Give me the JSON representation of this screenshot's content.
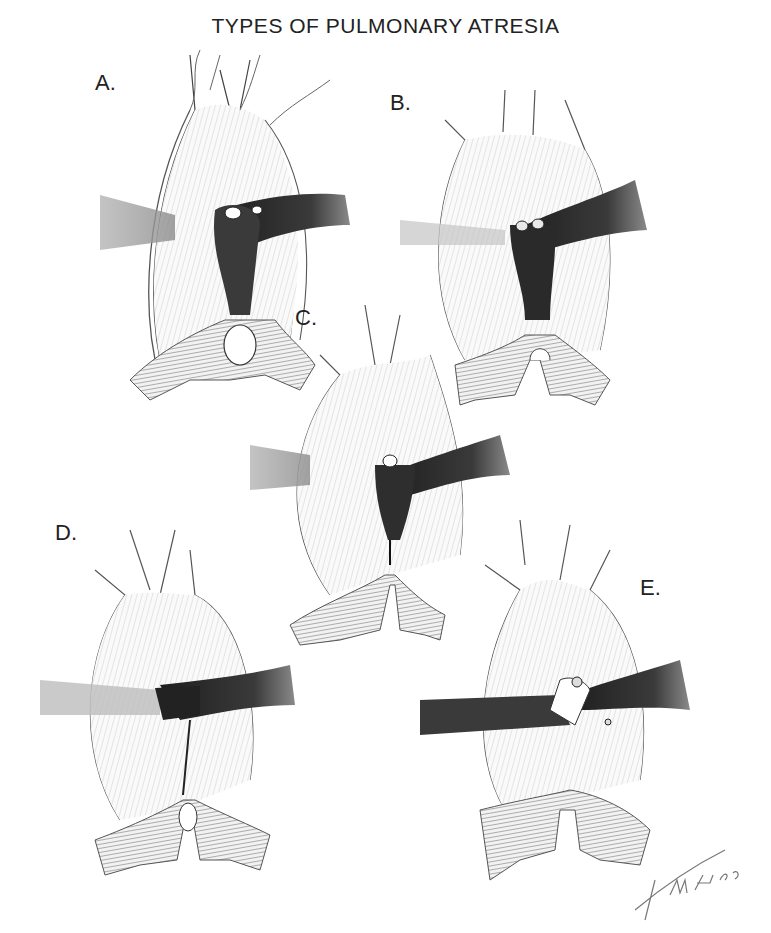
{
  "figure": {
    "title": "TYPES OF PULMONARY ATRESIA",
    "signature": "Finch '85",
    "colors": {
      "background": "#ffffff",
      "ink": "#222222",
      "vessel_dark": "#2b2b2b",
      "hatch": "#9a9a9a",
      "light_shade": "#d8d8d8"
    }
  },
  "panels": [
    {
      "id": "A",
      "label": "A."
    },
    {
      "id": "B",
      "label": "B."
    },
    {
      "id": "C",
      "label": "C."
    },
    {
      "id": "D",
      "label": "D."
    },
    {
      "id": "E",
      "label": "E."
    }
  ]
}
